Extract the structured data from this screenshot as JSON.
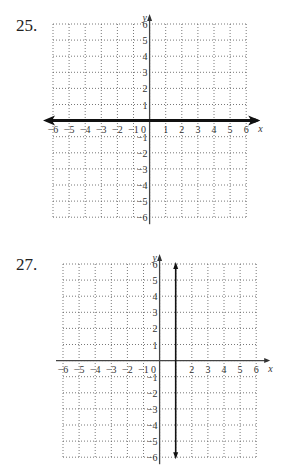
{
  "problems": [
    {
      "number": "25."
    },
    {
      "number": "27."
    }
  ],
  "chart_data": [
    {
      "type": "line",
      "problem": "25.",
      "title": "",
      "xlabel": "x",
      "ylabel": "y",
      "xlim": [
        -6,
        6
      ],
      "ylim": [
        -6,
        6
      ],
      "grid": true,
      "grid_style": "dotted",
      "x_ticks": [
        -6,
        -5,
        -4,
        -3,
        -2,
        -1,
        0,
        1,
        2,
        3,
        4,
        5,
        6
      ],
      "y_ticks": [
        6,
        5,
        4,
        3,
        2,
        1,
        -1,
        -2,
        -3,
        -4,
        -5,
        -6
      ],
      "series": [
        {
          "name": "y = 0",
          "equation": "y = 0",
          "orientation": "horizontal",
          "value": 0,
          "style": "thick line with arrows both ends",
          "x": [
            -6,
            6
          ],
          "y": [
            0,
            0
          ]
        }
      ]
    },
    {
      "type": "line",
      "problem": "27.",
      "title": "",
      "xlabel": "x",
      "ylabel": "y",
      "xlim": [
        -6,
        6
      ],
      "ylim": [
        -6,
        6
      ],
      "grid": true,
      "grid_style": "dotted",
      "x_ticks": [
        -6,
        -5,
        -4,
        -3,
        -2,
        -1,
        0,
        2,
        3,
        4,
        5,
        6
      ],
      "y_ticks": [
        6,
        5,
        4,
        3,
        2,
        1,
        -1,
        -2,
        -3,
        -4,
        -5,
        -6
      ],
      "series": [
        {
          "name": "x = 1",
          "equation": "x = 1",
          "orientation": "vertical",
          "value": 1,
          "style": "line with arrows both ends",
          "x": [
            1,
            1
          ],
          "y": [
            -6,
            6
          ]
        }
      ]
    }
  ]
}
